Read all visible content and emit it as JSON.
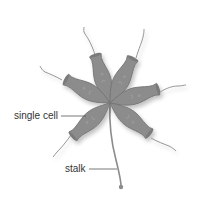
{
  "diagram": {
    "labels": {
      "single_cell": "single cell",
      "stalk": "stalk"
    },
    "colors": {
      "cell_fill": "#8c8c8c",
      "cell_stroke": "#6e6e6e",
      "flagellum": "#8a8a8a",
      "leader_line": "#555555",
      "label_text": "#333333"
    },
    "cell_count": 6
  }
}
